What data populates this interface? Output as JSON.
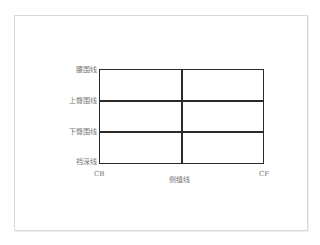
{
  "diagram": {
    "title": "",
    "row_labels": [
      "腰围线",
      "上臀围线",
      "下臀围线",
      "裆深线"
    ],
    "bottom_left_label": "CB",
    "bottom_right_label": "CF",
    "bottom_center_label": "侧缝线",
    "grid": {
      "rows": 3,
      "columns": 2
    },
    "colors": {
      "line": "#2a2a2a",
      "label": "#777777",
      "frame": "#d9d9d9"
    }
  }
}
